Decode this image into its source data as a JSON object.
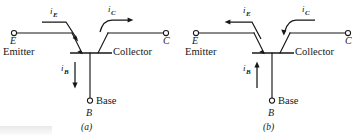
{
  "figure": {
    "background": "#ffffff",
    "ink": "#171717"
  },
  "panels": [
    {
      "id": "a",
      "caption": "(a)",
      "terminals": {
        "emitter_letter": "E",
        "emitter_word": "Emitter",
        "collector_letter": "C",
        "collector_word": "Collector",
        "base_letter": "B",
        "base_word": "Base"
      },
      "currents": [
        {
          "name": "i_E",
          "symbol": "i",
          "subscript": "E",
          "direction": "into-emitter-right-down"
        },
        {
          "name": "i_C",
          "symbol": "i",
          "subscript": "C",
          "direction": "out-of-collector-right"
        },
        {
          "name": "i_B",
          "symbol": "i",
          "subscript": "B",
          "direction": "down-into-base"
        }
      ]
    },
    {
      "id": "b",
      "caption": "(b)",
      "terminals": {
        "emitter_letter": "E",
        "emitter_word": "Emitter",
        "collector_letter": "C",
        "collector_word": "Collector",
        "base_letter": "B",
        "base_word": "Base"
      },
      "currents": [
        {
          "name": "i_E",
          "symbol": "i",
          "subscript": "E",
          "direction": "out-of-emitter-left"
        },
        {
          "name": "i_C",
          "symbol": "i",
          "subscript": "C",
          "direction": "into-collector-left-down"
        },
        {
          "name": "i_B",
          "symbol": "i",
          "subscript": "B",
          "direction": "up-out-of-base"
        }
      ]
    }
  ]
}
